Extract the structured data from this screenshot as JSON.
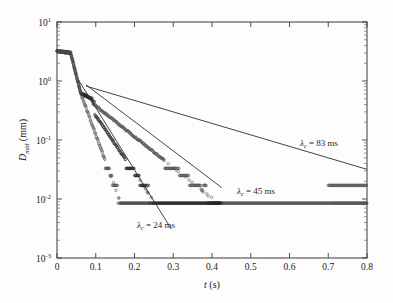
{
  "figure": {
    "background_color": "#fdfdfd",
    "frame_color": "#3a3a3a",
    "plot_area": {
      "left": 57,
      "top": 22,
      "right": 367,
      "bottom": 258
    }
  },
  "chart_data": {
    "type": "scatter",
    "title": "",
    "subtitle": "",
    "xlabel": "t (s)",
    "xlabel_parts": {
      "symbol": "t",
      "unit": "(s)"
    },
    "ylabel": "D_mid (mm)",
    "ylabel_parts": {
      "symbol": "D",
      "subscript": "mid",
      "unit": "(mm)"
    },
    "xlim": [
      0,
      0.8
    ],
    "ylim": [
      0.001,
      10
    ],
    "yscale": "log",
    "xscale": "linear",
    "grid": false,
    "legend": "none",
    "xticks": [
      0,
      0.1,
      0.2,
      0.3,
      0.4,
      0.5,
      0.6,
      0.7,
      0.8
    ],
    "xticklabels": [
      "0",
      "0.1",
      "0.2",
      "0.3",
      "0.4",
      "0.5",
      "0.6",
      "0.7",
      "0.8"
    ],
    "yticks": [
      10,
      1,
      0.1,
      0.01,
      0.001
    ],
    "yticklabels": [
      "10^1",
      "10^0",
      "10^-1",
      "10^-2",
      "10^-3"
    ],
    "ytick_mantissa": "10",
    "ytick_exponents": [
      "1",
      "0",
      "-1",
      "-2",
      "-3"
    ],
    "marker": "open-circle",
    "marker_size": 2.2,
    "series": [
      {
        "name": "decay-fast",
        "lambda_c_ms": 24,
        "color": "#4a4a4a",
        "D0_mm": 3.2,
        "plateau_mm": 0.0085,
        "t_end_s": 0.24,
        "quantization_levels_mm": [
          0.0085,
          0.017,
          0.025,
          0.033
        ],
        "description": "fastest exponential decay, reaches detection floor near t = 0.22 s"
      },
      {
        "name": "decay-medium",
        "lambda_c_ms": 45,
        "color": "#262626",
        "D0_mm": 3.2,
        "plateau_mm": 0.0085,
        "t_end_s": 0.42,
        "quantization_levels_mm": [
          0.0085,
          0.017,
          0.025,
          0.033
        ],
        "description": "intermediate exponential decay with shoulder near t = 0.07 s"
      },
      {
        "name": "decay-slow",
        "lambda_c_ms": 83,
        "color": "#555555",
        "D0_mm": 3.2,
        "plateau_mm": 0.0085,
        "t_end_s": 0.8,
        "quantization_levels_mm": [
          0.0085,
          0.017,
          0.025,
          0.033
        ],
        "description": "slowest exponential decay, extends to the right edge of the plot"
      }
    ],
    "fit_lines": [
      {
        "name": "fit-24ms",
        "lambda_c_ms": 24,
        "x0": 0.055,
        "y0": 1.05,
        "x1": 0.295,
        "y1": 0.0031
      },
      {
        "name": "fit-45ms",
        "lambda_c_ms": 45,
        "x0": 0.075,
        "y0": 0.86,
        "x1": 0.425,
        "y1": 0.0156
      },
      {
        "name": "fit-83ms",
        "lambda_c_ms": 83,
        "x0": 0.075,
        "y0": 0.82,
        "x1": 0.8,
        "y1": 0.0318
      }
    ],
    "annotations": [
      {
        "name": "lambda-24",
        "text": "λc = 24 ms",
        "symbol": "λ",
        "subscript": "c",
        "value": "24",
        "unit": "ms",
        "x_px": 137,
        "y_px": 228
      },
      {
        "name": "lambda-45",
        "text": "λc = 45 ms",
        "symbol": "λ",
        "subscript": "c",
        "value": "45",
        "unit": "ms",
        "x_px": 237,
        "y_px": 194
      },
      {
        "name": "lambda-83",
        "text": "λc = 83 ms",
        "symbol": "λ",
        "subscript": "c",
        "value": "83",
        "unit": "ms",
        "x_px": 300,
        "y_px": 146
      }
    ]
  }
}
